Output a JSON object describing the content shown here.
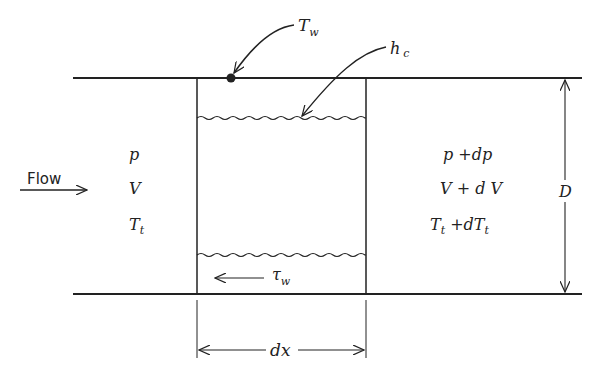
{
  "diagram": {
    "flow_label": "Flow",
    "inlet": {
      "pressure": "p",
      "velocity": "V",
      "total_temp_base": "T",
      "total_temp_sub": "t"
    },
    "outlet": {
      "pressure": "p +dp",
      "velocity": "V + d V",
      "total_temp_base": "T",
      "total_temp_sub": "t",
      "total_temp_mid": " +dT",
      "total_temp_sub2": "t"
    },
    "wall_temp": {
      "base": "T",
      "sub": "w"
    },
    "heat_transfer_coeff": {
      "base": "h",
      "sub": "c"
    },
    "wall_shear": {
      "base": "τ",
      "sub": "w"
    },
    "diameter_label": "D",
    "length_label": "dx",
    "colors": {
      "line": "#222222",
      "background": "#ffffff"
    }
  }
}
